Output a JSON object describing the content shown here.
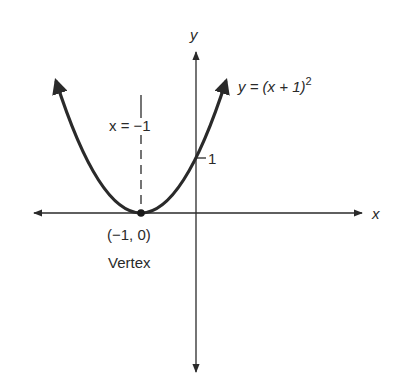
{
  "diagram": {
    "equation_label": "y = (x + 1)",
    "equation_exponent": "2",
    "axis_of_symmetry_label": "x = −1",
    "x_axis_label": "x",
    "y_axis_label": "y",
    "y_intercept_tick_label": "1",
    "vertex_coords_label": "(−1, 0)",
    "vertex_label": "Vertex",
    "colors": {
      "ink": "#2a2a2a",
      "background": "#ffffff"
    }
  }
}
